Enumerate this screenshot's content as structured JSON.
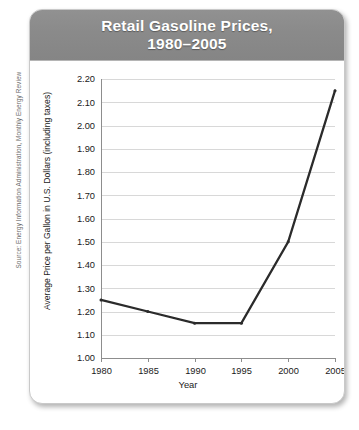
{
  "figure": {
    "title_line1": "Retail Gasoline Prices,",
    "title_line2": "1980–2005",
    "source_note": "Source: Energy Information Administration, Monthly Energy Review",
    "colors": {
      "title_bar": "#8a8a8a",
      "title_text": "#ffffff",
      "line": "#2b2b2b",
      "gridline": "#d8d8d8",
      "axis": "#8d8d8d",
      "card_background": "#ffffff"
    }
  },
  "chart_data": {
    "type": "line",
    "title": "Retail Gasoline Prices, 1980–2005",
    "xlabel": "Year",
    "ylabel": "Average Price per Gallon in U.S. Dollars (including taxes)",
    "x": [
      1980,
      1985,
      1990,
      1995,
      2000,
      2005
    ],
    "values": [
      1.25,
      1.2,
      1.15,
      1.15,
      1.5,
      2.15
    ],
    "series": [
      {
        "name": "Average price per gallon",
        "values": [
          1.25,
          1.2,
          1.15,
          1.15,
          1.5,
          2.15
        ]
      }
    ],
    "xlim": [
      1980,
      2005
    ],
    "ylim": [
      1.0,
      2.2
    ],
    "xticks": [
      1980,
      1985,
      1990,
      1995,
      2000,
      2005
    ],
    "xtick_labels": [
      "1980",
      "1985",
      "1990",
      "1995",
      "2000",
      "2005"
    ],
    "yticks": [
      1.0,
      1.1,
      1.2,
      1.3,
      1.4,
      1.5,
      1.6,
      1.7,
      1.8,
      1.9,
      2.0,
      2.1,
      2.2
    ],
    "ytick_labels": [
      "1.00",
      "1.10",
      "1.20",
      "1.30",
      "1.40",
      "1.50",
      "1.60",
      "1.70",
      "1.80",
      "1.90",
      "2.00",
      "2.10",
      "2.20"
    ],
    "grid": true,
    "grid_axis": "y",
    "legend": false,
    "markers": true
  }
}
